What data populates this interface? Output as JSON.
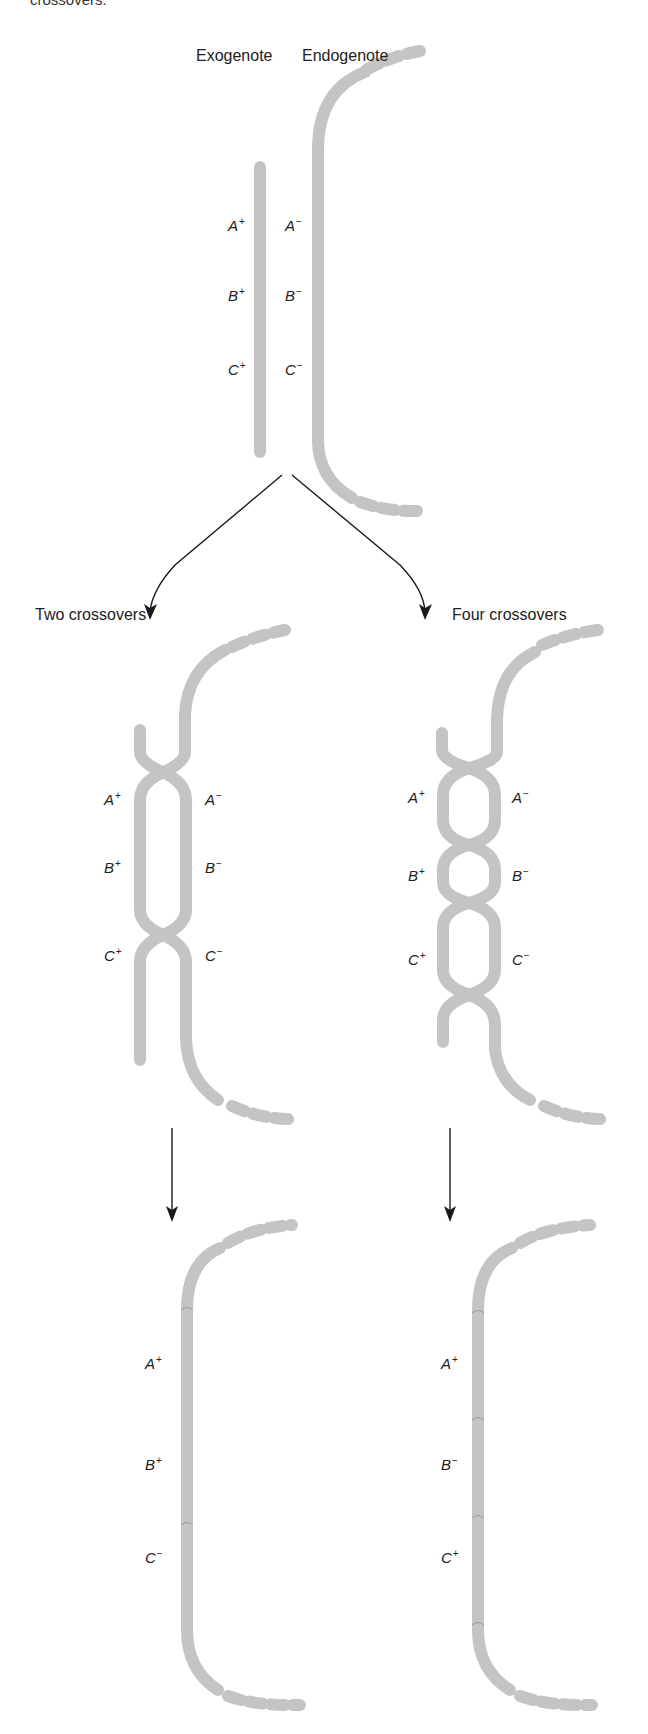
{
  "caption_fragment": "crossovers.",
  "top_panel": {
    "exogenote_label": "Exogenote",
    "endogenote_label": "Endogenote",
    "exogenote_genes": [
      {
        "letter": "A",
        "sign": "+"
      },
      {
        "letter": "B",
        "sign": "+"
      },
      {
        "letter": "C",
        "sign": "+"
      }
    ],
    "endogenote_genes": [
      {
        "letter": "A",
        "sign": "−"
      },
      {
        "letter": "B",
        "sign": "−"
      },
      {
        "letter": "C",
        "sign": "−"
      }
    ]
  },
  "branches": {
    "left_label": "Two crossovers",
    "right_label": "Four crossovers"
  },
  "two_crossovers": {
    "exo_genes": [
      {
        "letter": "A",
        "sign": "+"
      },
      {
        "letter": "B",
        "sign": "+"
      },
      {
        "letter": "C",
        "sign": "+"
      }
    ],
    "endo_genes": [
      {
        "letter": "A",
        "sign": "−"
      },
      {
        "letter": "B",
        "sign": "−"
      },
      {
        "letter": "C",
        "sign": "−"
      }
    ],
    "result_genes": [
      {
        "letter": "A",
        "sign": "+"
      },
      {
        "letter": "B",
        "sign": "+"
      },
      {
        "letter": "C",
        "sign": "−"
      }
    ]
  },
  "four_crossovers": {
    "exo_genes": [
      {
        "letter": "A",
        "sign": "+"
      },
      {
        "letter": "B",
        "sign": "+"
      },
      {
        "letter": "C",
        "sign": "+"
      }
    ],
    "endo_genes": [
      {
        "letter": "A",
        "sign": "−"
      },
      {
        "letter": "B",
        "sign": "−"
      },
      {
        "letter": "C",
        "sign": "−"
      }
    ],
    "result_genes": [
      {
        "letter": "A",
        "sign": "+"
      },
      {
        "letter": "B",
        "sign": "−"
      },
      {
        "letter": "C",
        "sign": "+"
      }
    ]
  },
  "colors": {
    "strand": "#c4c4c4",
    "arrow": "#1a1a1a",
    "text": "#222222"
  }
}
